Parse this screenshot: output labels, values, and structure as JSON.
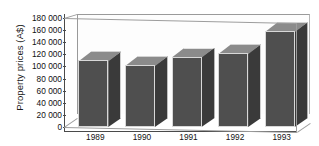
{
  "chart_data": {
    "type": "bar",
    "title": "",
    "xlabel": "",
    "ylabel": "Property prices (A$)",
    "categories": [
      "1989",
      "1990",
      "1991",
      "1992",
      "1993"
    ],
    "values": [
      110000,
      102000,
      116000,
      122000,
      158000
    ],
    "ylim": [
      0,
      180000
    ],
    "ytick_values": [
      0,
      20000,
      40000,
      60000,
      80000,
      100000,
      120000,
      140000,
      160000,
      180000
    ],
    "ytick_labels": [
      "0",
      "20 000",
      "40 000",
      "60 000",
      "80 000",
      "100 000",
      "120 000",
      "140 000",
      "160 000",
      "180 000"
    ],
    "grid": false,
    "legend": null,
    "style": "3d-bar-grayscale",
    "colors": {
      "bar_front": "#4f4f4f",
      "bar_top": "#8b8b8b",
      "bar_side": "#3a3a3a",
      "axis": "#4a4a4a",
      "frame": "#9a9a9a",
      "background": "#ffffff",
      "text": "#111111"
    }
  }
}
